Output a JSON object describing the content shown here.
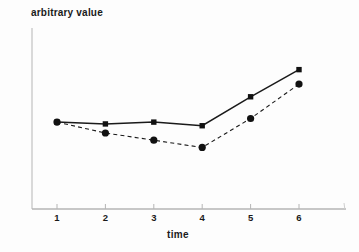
{
  "chart_data": {
    "type": "line",
    "title": "",
    "xlabel": "time",
    "ylabel": "arbitrary value",
    "x": [
      1,
      2,
      3,
      4,
      5,
      6
    ],
    "x_tick_labels": [
      "1",
      "2",
      "3",
      "4",
      "5",
      "6"
    ],
    "ylim": [
      0,
      10
    ],
    "xlim": [
      0.5,
      6.95
    ],
    "grid": false,
    "legend": "none",
    "y_tick_labels": [],
    "series": [
      {
        "name": "series-solid-squares",
        "marker": "square",
        "line_style": "solid",
        "values": [
          4.8,
          4.7,
          4.8,
          4.6,
          6.2,
          7.7
        ]
      },
      {
        "name": "series-dashed-circles",
        "marker": "circle",
        "line_style": "dashed",
        "values": [
          4.8,
          4.2,
          3.8,
          3.4,
          5.0,
          6.9
        ]
      }
    ],
    "colors": {
      "line": "#1a1a1a",
      "marker": "#111111",
      "axis": "#b5b5b5",
      "text": "#1a1a1a",
      "background": "#fdfdfd"
    }
  }
}
